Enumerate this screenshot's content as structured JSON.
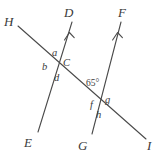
{
  "figure": {
    "type": "geometry-diagram",
    "background_color": "#ffffff",
    "stroke_color": "#4a4a4a",
    "label_color": "#3a3a3a"
  },
  "lines": [
    {
      "name": "parallel-line-ED",
      "from_label": "E",
      "to_label": "D",
      "marker": "single-arrow",
      "x1": 38,
      "y1": 132,
      "x2": 72,
      "y2": 22
    },
    {
      "name": "parallel-line-GF",
      "from_label": "G",
      "to_label": "F",
      "marker": "single-arrow",
      "x1": 92,
      "y1": 134,
      "x2": 121,
      "y2": 22
    },
    {
      "name": "transversal-HI",
      "from_label": "H",
      "to_label": "I",
      "marker": "none",
      "x1": 18,
      "y1": 26,
      "x2": 146,
      "y2": 139
    }
  ],
  "point_labels": [
    {
      "text": "H",
      "x": 4,
      "y": 15
    },
    {
      "text": "D",
      "x": 64,
      "y": 6
    },
    {
      "text": "F",
      "x": 118,
      "y": 6
    },
    {
      "text": "E",
      "x": 24,
      "y": 136
    },
    {
      "text": "G",
      "x": 78,
      "y": 139
    },
    {
      "text": "I",
      "x": 147,
      "y": 139
    }
  ],
  "intersections": [
    {
      "name": "intersection-C",
      "vertex_label": "C",
      "x": 62,
      "y": 62,
      "angles": [
        {
          "text": "a",
          "x": 52,
          "y": 48
        },
        {
          "text": "b",
          "x": 42,
          "y": 62
        },
        {
          "text": "C",
          "x": 63,
          "y": 58
        },
        {
          "text": "d",
          "x": 54,
          "y": 73
        }
      ]
    },
    {
      "name": "intersection-lower",
      "vertex_label": "",
      "x": 103,
      "y": 100,
      "angles": [
        {
          "text": "65°",
          "x": 86,
          "y": 79
        },
        {
          "text": "f",
          "x": 90,
          "y": 100
        },
        {
          "text": "g",
          "x": 105,
          "y": 95
        },
        {
          "text": "h",
          "x": 96,
          "y": 110
        }
      ]
    }
  ]
}
